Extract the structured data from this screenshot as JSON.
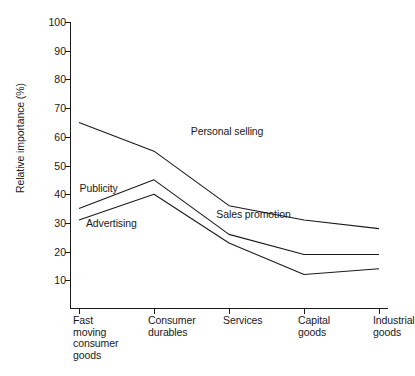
{
  "chart_data": {
    "type": "line",
    "title": "",
    "xlabel": "",
    "ylabel": "Relative importance (%)",
    "ylim": [
      0,
      100
    ],
    "yticks": [
      10,
      20,
      30,
      40,
      50,
      60,
      70,
      80,
      90,
      100
    ],
    "grid": false,
    "legend": "inline-labels",
    "categories": [
      "Fast\nmoving\nconsumer\ngoods",
      "Consumer\ndurables",
      "Services",
      "Capital\ngoods",
      "Industrial\ngoods"
    ],
    "series": [
      {
        "name": "Personal selling",
        "values": [
          65,
          55,
          36,
          31,
          28
        ]
      },
      {
        "name": "Sales promotion",
        "values": [
          35,
          45,
          26,
          19,
          19
        ]
      },
      {
        "name": "Publicity",
        "values": [
          35,
          45,
          26,
          19,
          19
        ]
      },
      {
        "name": "Advertising",
        "values": [
          31,
          40,
          23,
          12,
          14
        ]
      }
    ],
    "annotations": [
      {
        "text": "Personal selling",
        "x_frac": 0.38,
        "y_value": 62
      },
      {
        "text": "Sales promotion",
        "x_frac": 0.46,
        "y_value": 33
      },
      {
        "text": "Publicity",
        "x_frac": 0.03,
        "y_value": 42
      },
      {
        "text": "Advertising",
        "x_frac": 0.05,
        "y_value": 30
      }
    ]
  },
  "axis": {
    "y_title": "Relative importance (%)",
    "y_tick_labels": [
      "100",
      "90",
      "80",
      "70",
      "60",
      "50",
      "40",
      "30",
      "20",
      "10"
    ],
    "x_tick_labels": [
      "Fast\nmoving\nconsumer\ngoods",
      "Consumer\ndurables",
      "Services",
      "Capital\ngoods",
      "Industrial\ngoods"
    ]
  },
  "series_labels": {
    "personal_selling": "Personal selling",
    "sales_promotion": "Sales promotion",
    "publicity": "Publicity",
    "advertising": "Advertising"
  },
  "colors": {
    "line": "#1a1a1a",
    "axis": "#1a1a1a",
    "text": "#1a1a1a",
    "background": "#ffffff"
  }
}
